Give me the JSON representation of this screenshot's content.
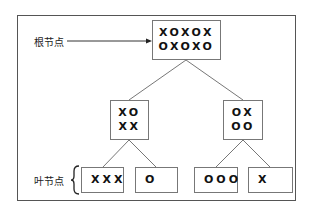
{
  "diagram": {
    "type": "tree",
    "labels": {
      "root": "根节点",
      "leaves": "叶节点"
    },
    "root": {
      "rows": [
        "XOXOX",
        "OXOXO"
      ]
    },
    "level1": [
      {
        "rows": [
          "XO",
          "XX"
        ]
      },
      {
        "rows": [
          "OX",
          "OO"
        ]
      }
    ],
    "leaves": [
      {
        "text": "XXX"
      },
      {
        "text": "O"
      },
      {
        "text": "OOO"
      },
      {
        "text": "X"
      }
    ],
    "colors": {
      "line": "#777777",
      "frame": "#555555",
      "text": "#111111"
    }
  }
}
